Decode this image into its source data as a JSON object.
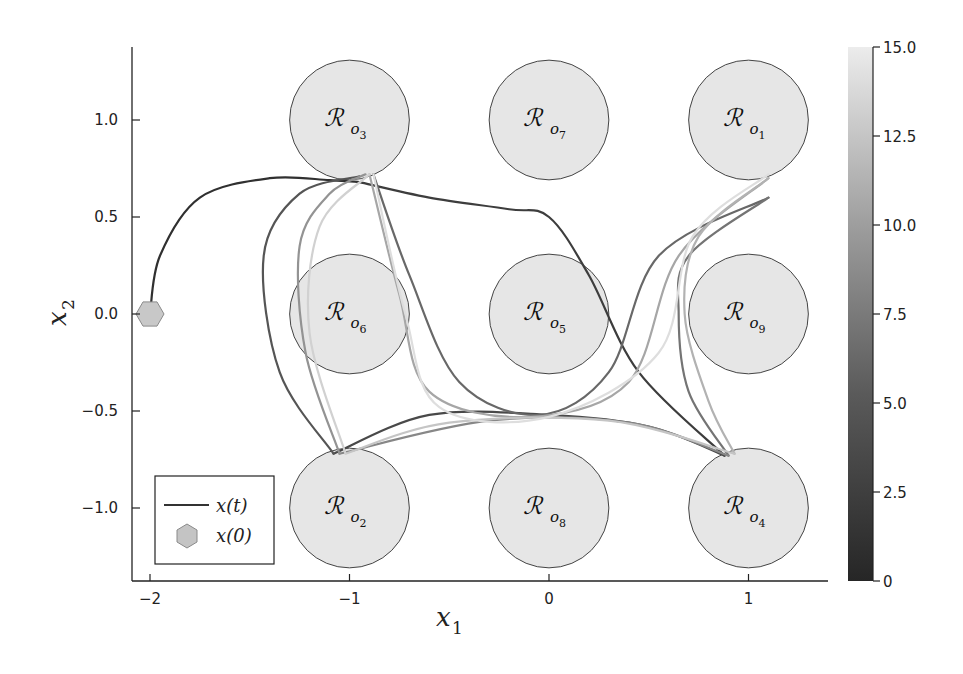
{
  "chart_data": {
    "type": "line",
    "title": "",
    "xlabel": "x_1",
    "ylabel": "x_2",
    "xlim": [
      -2.1,
      1.4
    ],
    "ylim": [
      -1.38,
      1.38
    ],
    "x_ticks": [
      "-2",
      "-1",
      "0",
      "1"
    ],
    "x_tick_values": [
      -2,
      -1,
      0,
      1
    ],
    "y_ticks": [
      "1.0",
      "0.5",
      "0.0",
      "-0.5",
      "-1.0"
    ],
    "y_tick_values": [
      1.0,
      0.5,
      0.0,
      -0.5,
      -1.0
    ],
    "grid": false,
    "legend": {
      "position": "bottom-left",
      "entries": [
        {
          "label": "x(t)",
          "marker": "line"
        },
        {
          "label": "x(0)",
          "marker": "hexagon"
        }
      ]
    },
    "colorbar": {
      "min": 0,
      "max": 15.0,
      "ticks": [
        "15.0",
        "12.5",
        "10.0",
        "7.5",
        "5.0",
        "2.5",
        "0"
      ],
      "tick_values": [
        15.0,
        12.5,
        10.0,
        7.5,
        5.0,
        2.5,
        0
      ],
      "colormap": "grayscale dark-to-light",
      "color_low": "#2a2a2a",
      "color_high": "#e8e8e8"
    },
    "initial_state": {
      "x1": -2.0,
      "x2": 0.0,
      "marker": "hexagon",
      "color": "#c8c8c8"
    },
    "regions": [
      {
        "name": "R_o1",
        "label": "R",
        "sub": "o",
        "subsub": "1",
        "cx": 1.0,
        "cy": 1.0,
        "r": 0.3
      },
      {
        "name": "R_o2",
        "label": "R",
        "sub": "o",
        "subsub": "2",
        "cx": -1.0,
        "cy": -1.0,
        "r": 0.3
      },
      {
        "name": "R_o3",
        "label": "R",
        "sub": "o",
        "subsub": "3",
        "cx": -1.0,
        "cy": 1.0,
        "r": 0.3
      },
      {
        "name": "R_o4",
        "label": "R",
        "sub": "o",
        "subsub": "4",
        "cx": 1.0,
        "cy": -1.0,
        "r": 0.3
      },
      {
        "name": "R_o5",
        "label": "R",
        "sub": "o",
        "subsub": "5",
        "cx": 0.0,
        "cy": 0.0,
        "r": 0.3
      },
      {
        "name": "R_o6",
        "label": "R",
        "sub": "o",
        "subsub": "6",
        "cx": -1.0,
        "cy": 0.0,
        "r": 0.3
      },
      {
        "name": "R_o7",
        "label": "R",
        "sub": "o",
        "subsub": "7",
        "cx": 0.0,
        "cy": 1.0,
        "r": 0.3
      },
      {
        "name": "R_o8",
        "label": "R",
        "sub": "o",
        "subsub": "8",
        "cx": 0.0,
        "cy": -1.0,
        "r": 0.3
      },
      {
        "name": "R_o9",
        "label": "R",
        "sub": "o",
        "subsub": "9",
        "cx": 1.0,
        "cy": 0.0,
        "r": 0.3
      }
    ],
    "region_fill": "#e6e6e6",
    "series": [
      {
        "name": "x(t) segment 1 (x0 to R_o3)",
        "time": 0.5,
        "points": [
          [
            -2.0,
            0.0
          ],
          [
            -1.95,
            0.3
          ],
          [
            -1.75,
            0.6
          ],
          [
            -1.4,
            0.7
          ],
          [
            -1.1,
            0.69
          ],
          [
            -0.95,
            0.68
          ]
        ]
      },
      {
        "name": "x(t) segment 2 (R_o3 to R_o4 via top)",
        "time": 1.5,
        "points": [
          [
            -0.95,
            0.68
          ],
          [
            -0.6,
            0.6
          ],
          [
            -0.2,
            0.54
          ],
          [
            0.0,
            0.5
          ],
          [
            0.2,
            0.2
          ],
          [
            0.45,
            -0.3
          ],
          [
            0.88,
            -0.73
          ]
        ]
      },
      {
        "name": "x(t) segment 3 (R_o4 to R_o2)",
        "time": 2.5,
        "points": [
          [
            0.88,
            -0.73
          ],
          [
            0.5,
            -0.58
          ],
          [
            0.0,
            -0.52
          ],
          [
            -0.6,
            -0.52
          ],
          [
            -1.08,
            -0.72
          ]
        ]
      },
      {
        "name": "x(t) segment 4 (R_o2 to R_o3 left)",
        "time": 3.5,
        "points": [
          [
            -1.08,
            -0.72
          ],
          [
            -1.35,
            -0.3
          ],
          [
            -1.43,
            0.3
          ],
          [
            -1.25,
            0.62
          ],
          [
            -0.95,
            0.71
          ]
        ]
      },
      {
        "name": "x(t) segment 5 (R_o3 to R_o1)",
        "time": 5.0,
        "points": [
          [
            -0.88,
            0.72
          ],
          [
            -0.7,
            0.2
          ],
          [
            -0.45,
            -0.35
          ],
          [
            -0.05,
            -0.52
          ],
          [
            0.3,
            -0.3
          ],
          [
            0.55,
            0.3
          ],
          [
            1.1,
            0.6
          ]
        ]
      },
      {
        "name": "x(t) segment 6 (R_o1 to R_o4)",
        "time": 6.0,
        "points": [
          [
            1.1,
            0.6
          ],
          [
            0.7,
            0.3
          ],
          [
            0.65,
            0.0
          ],
          [
            0.7,
            -0.4
          ],
          [
            0.9,
            -0.73
          ]
        ]
      },
      {
        "name": "x(t) segment 7 (R_o4 to R_o2)",
        "time": 7.5,
        "points": [
          [
            0.9,
            -0.73
          ],
          [
            0.4,
            -0.56
          ],
          [
            -0.3,
            -0.55
          ],
          [
            -1.05,
            -0.72
          ]
        ]
      },
      {
        "name": "x(t) segment 8 (R_o2 to R_o3)",
        "time": 8.5,
        "points": [
          [
            -1.05,
            -0.72
          ],
          [
            -1.22,
            -0.2
          ],
          [
            -1.25,
            0.35
          ],
          [
            -1.1,
            0.62
          ],
          [
            -0.92,
            0.72
          ]
        ]
      },
      {
        "name": "x(t) segment 9 (R_o3 to R_o1 via center)",
        "time": 10.0,
        "points": [
          [
            -0.9,
            0.72
          ],
          [
            -0.75,
            0.1
          ],
          [
            -0.6,
            -0.4
          ],
          [
            -0.1,
            -0.53
          ],
          [
            0.4,
            -0.35
          ],
          [
            0.65,
            0.3
          ],
          [
            1.1,
            0.7
          ]
        ]
      },
      {
        "name": "x(t) segment 10 (R_o1 to R_o4)",
        "time": 11.0,
        "points": [
          [
            1.1,
            0.7
          ],
          [
            0.75,
            0.4
          ],
          [
            0.68,
            0.0
          ],
          [
            0.8,
            -0.45
          ],
          [
            0.93,
            -0.72
          ]
        ]
      },
      {
        "name": "x(t) segment 11 (R_o4 to R_o2)",
        "time": 12.5,
        "points": [
          [
            0.93,
            -0.72
          ],
          [
            0.3,
            -0.55
          ],
          [
            -0.5,
            -0.56
          ],
          [
            -1.02,
            -0.72
          ]
        ]
      },
      {
        "name": "x(t) segment 12 (R_o2 to R_o3)",
        "time": 13.5,
        "points": [
          [
            -1.02,
            -0.72
          ],
          [
            -1.2,
            -0.1
          ],
          [
            -1.15,
            0.45
          ],
          [
            -0.9,
            0.72
          ]
        ]
      },
      {
        "name": "x(t) segment 13 (R_o3 to R_o1)",
        "time": 14.5,
        "points": [
          [
            -0.88,
            0.72
          ],
          [
            -0.72,
            0.0
          ],
          [
            -0.55,
            -0.48
          ],
          [
            0.0,
            -0.53
          ],
          [
            0.55,
            -0.2
          ],
          [
            0.72,
            0.4
          ],
          [
            1.1,
            0.72
          ]
        ]
      }
    ]
  }
}
